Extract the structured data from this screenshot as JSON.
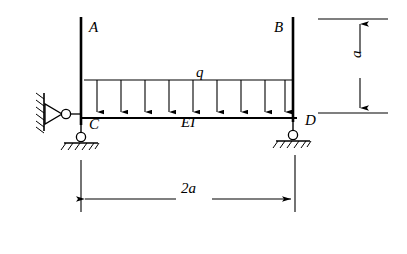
{
  "figure": {
    "type": "structural-frame-diagram",
    "labels": {
      "column_left_top": "A",
      "column_right_top": "B",
      "distributed_load": "q",
      "joint_left": "C",
      "joint_right": "D",
      "beam_flexural_rigidity": "EI",
      "height_dimension": "a",
      "span_dimension": "2a"
    },
    "dimensions": {
      "height": "a",
      "span": "2a"
    },
    "load": {
      "symbol": "q",
      "type": "uniformly distributed",
      "arrow_count": 9,
      "direction": "downward"
    },
    "supports": [
      {
        "name": "left-pin-support",
        "at": "C",
        "style": "pin-with-hatched-wall"
      },
      {
        "name": "left-base-support",
        "at": "C",
        "style": "roller-on-hatched-ground"
      },
      {
        "name": "right-base-support",
        "at": "D",
        "style": "roller-on-hatched-ground"
      }
    ],
    "colors": {
      "line": "#000000",
      "background": "#ffffff"
    }
  }
}
